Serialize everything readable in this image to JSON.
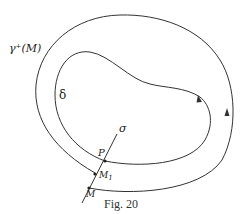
{
  "figure": {
    "caption": "Fig. 20",
    "labels": {
      "outer_orbit": "γ⁺(M)",
      "inner_cycle": "δ",
      "transversal": "σ",
      "point_p": "P",
      "point_m1": "M",
      "point_m1_subscript": "1",
      "point_m": "M"
    },
    "colors": {
      "stroke": "#333333",
      "text": "#222222",
      "background": "#ffffff"
    },
    "elements": [
      {
        "name": "outer-orbit",
        "description": "positive semi-orbit of M spiralling toward the cycle",
        "label": "γ⁺(M)"
      },
      {
        "name": "inner-cycle",
        "description": "closed curve (limit cycle)",
        "label": "δ"
      },
      {
        "name": "transversal",
        "description": "line segment crossing both curves",
        "label": "σ"
      }
    ]
  }
}
